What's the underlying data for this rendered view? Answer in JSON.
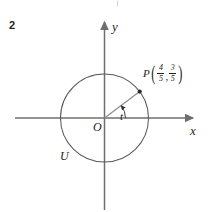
{
  "figure": {
    "problem_number": "2",
    "type": "unit-circle-diagram"
  },
  "axes": {
    "x_label": "x",
    "y_label": "y",
    "origin_label": "O"
  },
  "circle": {
    "label": "U",
    "center": [
      104.5,
      118
    ],
    "radius": 44,
    "stroke": "#5a5a5a"
  },
  "angle": {
    "label": "t"
  },
  "point": {
    "name": "P",
    "open_paren": "(",
    "close_paren": ")",
    "comma": ",",
    "x_numerator": "4",
    "x_denominator": "5",
    "y_numerator": "3",
    "y_denominator": "5",
    "dot_position": [
      139.7,
      91.6
    ]
  },
  "colors": {
    "axis": "#6e6e6e",
    "circle": "#5a5a5a",
    "radius": "#8a8a8a",
    "text": "#1d1d1d"
  }
}
